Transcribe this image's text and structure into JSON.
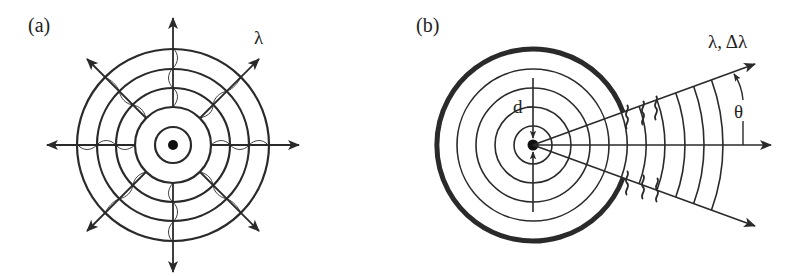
{
  "figure": {
    "panels": [
      {
        "id": "a",
        "label": "(a)",
        "annotation": "λ",
        "description": "Point source emitting spherical waves in all directions; concentric wavefronts with 8 radial arrows carrying wavy lines"
      },
      {
        "id": "b",
        "label": "(b)",
        "annotation_wavelength": "λ, Δλ",
        "annotation_angle": "θ",
        "annotation_size": "d",
        "description": "Source of size d enclosed by a thick boundary; waves exit through a cone of half-angle θ"
      }
    ],
    "colors": {
      "ink": "#2a2a2a",
      "background": "#ffffff"
    }
  }
}
